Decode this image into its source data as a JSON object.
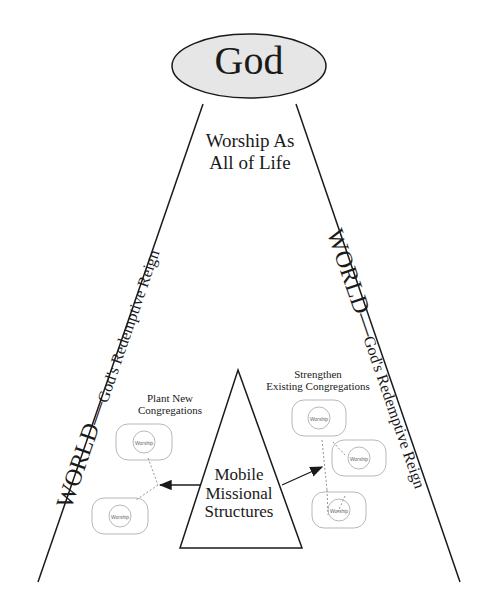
{
  "diagram": {
    "top_node": {
      "label": "God",
      "fill": "#e6e6e6"
    },
    "center_label": {
      "line1": "Worship As",
      "line2": "All of Life"
    },
    "left_side_label": {
      "main": "WORLD",
      "separator": "—",
      "sub": "God's Redemptive Reign"
    },
    "right_side_label": {
      "main": "WORLD",
      "separator": "—",
      "sub": "God's Redemptive Reign"
    },
    "left_branch": {
      "line1": "Plant New",
      "line2": "Congregations"
    },
    "right_branch": {
      "line1": "Strengthen",
      "line2": "Existing Congregations"
    },
    "core_triangle": {
      "line1": "Mobile",
      "line2": "Missional",
      "line3": "Structures"
    },
    "congregation_icon_label": "Worship",
    "colors": {
      "stroke": "#1a1a1a",
      "icon_stroke": "#9a9a9a"
    }
  }
}
